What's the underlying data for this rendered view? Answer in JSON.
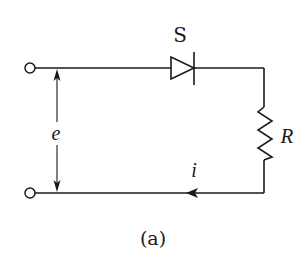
{
  "diagram": {
    "type": "circuit",
    "caption": "(a)",
    "components": {
      "diode": {
        "label": "S",
        "direction": "left-to-right"
      },
      "resistor": {
        "label": "R"
      },
      "source_voltage": {
        "label": "e"
      },
      "current": {
        "label": "i",
        "direction": "right-to-left on bottom wire"
      }
    },
    "terminals": [
      "top-left-terminal",
      "bottom-left-terminal"
    ],
    "colors": {
      "line": "#1a1a1a",
      "background": "#ffffff"
    }
  }
}
